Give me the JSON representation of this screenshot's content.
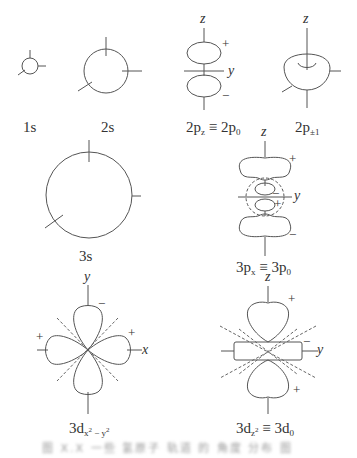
{
  "figure": {
    "type": "atomic orbital shapes diagram",
    "line_color": "#555555",
    "dashed_color": "#666666",
    "orbitals": [
      {
        "id": "1s",
        "label_main": "1s",
        "label_sub": "",
        "label_rest": ""
      },
      {
        "id": "2s",
        "label_main": "2s",
        "label_sub": "",
        "label_rest": ""
      },
      {
        "id": "2pz",
        "label_main": "2p",
        "label_sub": "z",
        "label_rest": " ≡ 2p",
        "label_sub2": "0"
      },
      {
        "id": "2p_pm1",
        "label_main": "2p",
        "label_sub": "±1",
        "label_rest": ""
      },
      {
        "id": "3s",
        "label_main": "3s",
        "label_sub": "",
        "label_rest": ""
      },
      {
        "id": "3px",
        "label_main": "3p",
        "label_sub": "x",
        "label_rest": " ≡ 3p",
        "label_sub2": "0"
      },
      {
        "id": "3dx2y2",
        "label_main": "3d",
        "label_sub_base1": "x",
        "label_sub_exp1": "2",
        "label_sub_mid": " − y",
        "label_sub_exp2": "2"
      },
      {
        "id": "3dz2",
        "label_main": "3d",
        "label_sub_base1": "z",
        "label_sub_exp1": "2",
        "label_rest": " ≡ 3d",
        "label_sub2": "0"
      }
    ],
    "axes": {
      "z": "z",
      "y": "y",
      "x": "x"
    },
    "signs": {
      "plus": "+",
      "minus": "−"
    },
    "caption": "图 X.X  一些 氢原子 轨道 的 角度 分布 图"
  }
}
